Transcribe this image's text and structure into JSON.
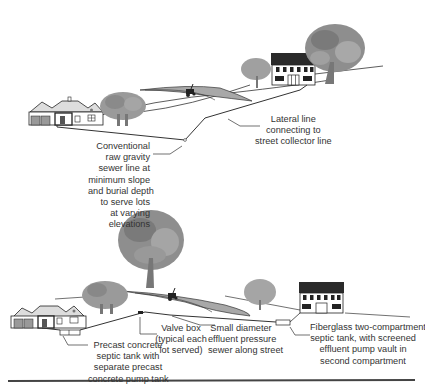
{
  "diagram": {
    "top_panel": {
      "title": "Conventional gravity sewer",
      "labels": {
        "lateral_line": [
          "Lateral line",
          "connecting to",
          "street collector line"
        ],
        "gravity_sewer": [
          "Conventional",
          "raw gravity",
          "sewer line at",
          "minimum slope",
          "and burial depth",
          "to serve lots",
          "at varying",
          "elevations"
        ]
      }
    },
    "bottom_panel": {
      "title": "Effluent pressure sewer",
      "labels": {
        "precast_tank": [
          "Precast concrete",
          "septic tank with",
          "separate precast",
          "concrete pump tank"
        ],
        "valve_box": [
          "Valve box",
          "(typical each",
          "lot served)"
        ],
        "pressure_sewer": [
          "Small diameter",
          "effluent pressure",
          "sewer along street"
        ],
        "fiberglass_tank": [
          "Fiberglass two-compartment",
          "septic tank, with screened",
          "effluent pump vault in",
          "second compartment"
        ]
      }
    },
    "colors": {
      "line": "#333333",
      "tree_fill": "#9a9a9a",
      "tree_dark": "#7a7a7a",
      "field_fill": "#a8a8a8",
      "roof_dark": "#2a2a2a",
      "rule": "#444444"
    }
  }
}
